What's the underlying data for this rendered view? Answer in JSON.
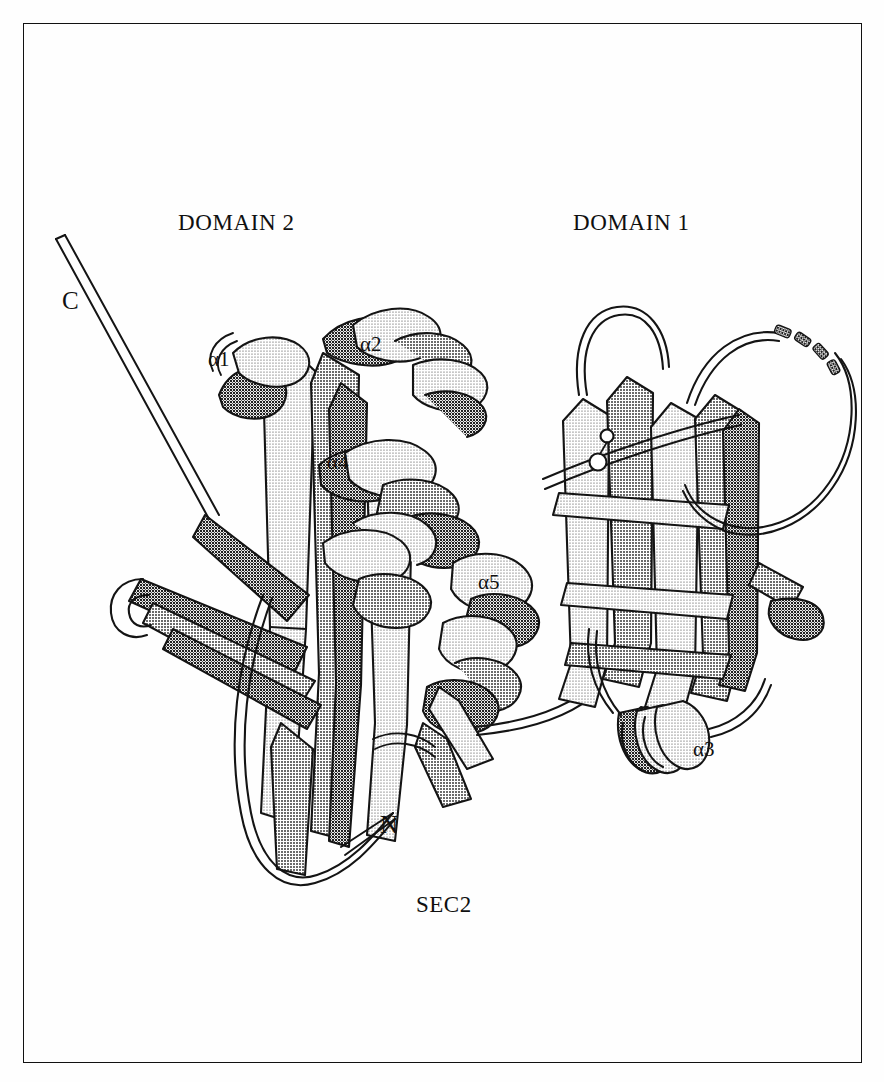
{
  "figure": {
    "caption": "SEC2",
    "domain_labels": [
      {
        "text": "DOMAIN 2",
        "x": 178,
        "y": 211
      },
      {
        "text": "DOMAIN 1",
        "x": 573,
        "y": 211
      }
    ],
    "terminus_labels": [
      {
        "text": "C",
        "x": 62,
        "y": 288
      },
      {
        "text": "N",
        "x": 380,
        "y": 812
      }
    ],
    "helix_labels": [
      {
        "text": "α1",
        "x": 208,
        "y": 349
      },
      {
        "text": "α2",
        "x": 360,
        "y": 334
      },
      {
        "text": "α4",
        "x": 327,
        "y": 452
      },
      {
        "text": "α5",
        "x": 478,
        "y": 572
      },
      {
        "text": "α3",
        "x": 693,
        "y": 739
      }
    ],
    "caption_position": {
      "x": 416,
      "y": 893
    },
    "colors": {
      "ink": "#101010",
      "outline": "#141414",
      "light_face": "#d9d9d9",
      "mid_face": "#b4b4b4",
      "dark_face": "#6e6e6e",
      "background": "#fefefe"
    },
    "frame": {
      "x": 23,
      "y": 23,
      "width": 839,
      "height": 1040
    },
    "notes": {
      "molecule": "SEC2",
      "domain_count": 2,
      "helix_count": 5,
      "disordered_loop": "dashed segment at upper right of Domain 1",
      "render_style": "halftone dot-screen ribbon diagram"
    }
  }
}
